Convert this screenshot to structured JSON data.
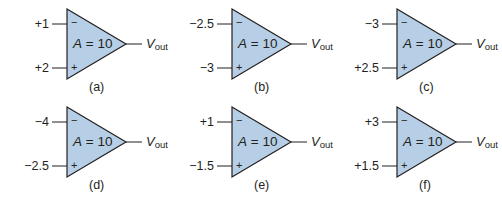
{
  "figure": {
    "fill_color": "#b7cfe6",
    "stroke_color": "#231f20",
    "output_label": {
      "main": "V",
      "sub": "out"
    },
    "gain_label": {
      "var": "A",
      "rest": " = 10"
    },
    "minus_sign": "−",
    "plus_sign": "+",
    "amplifiers": [
      {
        "inverting": "+1",
        "noninverting": "+2",
        "caption": "(a)"
      },
      {
        "inverting": "−2.5",
        "noninverting": "−3",
        "caption": "(b)"
      },
      {
        "inverting": "−3",
        "noninverting": "+2.5",
        "caption": "(c)"
      },
      {
        "inverting": "−4",
        "noninverting": "−2.5",
        "caption": "(d)"
      },
      {
        "inverting": "+1",
        "noninverting": "−1.5",
        "caption": "(e)"
      },
      {
        "inverting": "+3",
        "noninverting": "+1.5",
        "caption": "(f)"
      }
    ]
  }
}
